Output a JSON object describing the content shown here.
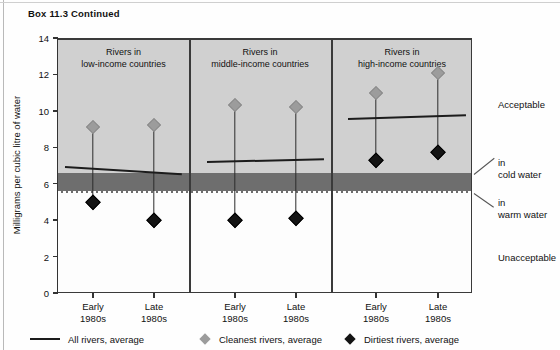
{
  "box_title": "Box 11.3  Continued",
  "chart_data": {
    "type": "scatter",
    "title": "Box 11.3  Continued",
    "ylabel": "Milligrams per cubic litre of water",
    "xlabel": "",
    "ylim": [
      0,
      14
    ],
    "yticks": [
      0,
      2,
      4,
      6,
      8,
      10,
      12,
      14
    ],
    "ytick_labels": [
      "0",
      "2",
      "4",
      "6",
      "8",
      "10",
      "12",
      "14"
    ],
    "grid": false,
    "categories": [
      "Early 1980s",
      "Late 1980s",
      "Early 1980s",
      "Late 1980s",
      "Early 1980s",
      "Late 1980s"
    ],
    "xtick_labels": [
      {
        "line1": "Early",
        "line2": "1980s"
      },
      {
        "line1": "Late",
        "line2": "1980s"
      },
      {
        "line1": "Early",
        "line2": "1980s"
      },
      {
        "line1": "Late",
        "line2": "1980s"
      },
      {
        "line1": "Early",
        "line2": "1980s"
      },
      {
        "line1": "Late",
        "line2": "1980s"
      }
    ],
    "panels": [
      {
        "label_line1": "Rivers in",
        "label_line2": "low-income countries",
        "points": [
          {
            "period": "Early 1980s",
            "cleanest": 9.1,
            "dirtiest": 5.0,
            "all_average": 7.0
          },
          {
            "period": "Late 1980s",
            "cleanest": 9.2,
            "dirtiest": 4.0,
            "all_average": 6.6
          }
        ]
      },
      {
        "label_line1": "Rivers in",
        "label_line2": "middle-income countries",
        "points": [
          {
            "period": "Early 1980s",
            "cleanest": 10.3,
            "dirtiest": 4.0,
            "all_average": 7.25
          },
          {
            "period": "Late 1980s",
            "cleanest": 10.2,
            "dirtiest": 4.1,
            "all_average": 7.4
          }
        ]
      },
      {
        "label_line1": "Rivers in",
        "label_line2": "high-income countries",
        "points": [
          {
            "period": "Early 1980s",
            "cleanest": 11.0,
            "dirtiest": 7.3,
            "all_average": 9.6
          },
          {
            "period": "Late 1980s",
            "cleanest": 12.1,
            "dirtiest": 7.75,
            "all_average": 9.8
          }
        ]
      }
    ],
    "bands": [
      {
        "name": "acceptable",
        "from": 6.6,
        "to": 14.0,
        "color": "#d0d0d0"
      },
      {
        "name": "cold-warm-threshold-band",
        "from": 5.5,
        "to": 6.6,
        "color": "#6e6e6e"
      },
      {
        "name": "unacceptable",
        "from": 0.0,
        "to": 5.5,
        "color": "#fdfdfd"
      }
    ],
    "annotations": [
      {
        "text": "Acceptable",
        "value": 9.0
      },
      {
        "text_line1": "in",
        "text_line2": "cold water",
        "value": 6.6
      },
      {
        "text_line1": "in",
        "text_line2": "warm water",
        "value": 5.5
      },
      {
        "text": "Unacceptable",
        "value": 2.9
      }
    ],
    "legend": {
      "position": "bottom",
      "entries": [
        {
          "marker": "line",
          "label": "All rivers, average"
        },
        {
          "marker": "diamond-gray",
          "label": "Cleanest rivers, average"
        },
        {
          "marker": "diamond-black",
          "label": "Dirtiest rivers, average"
        }
      ]
    }
  },
  "annotations": {
    "acceptable": "Acceptable",
    "cold_in": "in",
    "cold_water": "cold water",
    "warm_in": "in",
    "warm_water": "warm water",
    "unacceptable": "Unacceptable"
  }
}
